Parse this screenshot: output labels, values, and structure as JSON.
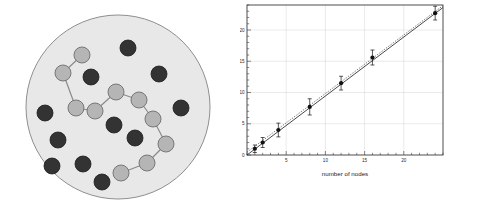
{
  "figure": {
    "panels": [
      "network-diagram",
      "speedup-chart"
    ]
  },
  "network": {
    "name": "network-diagram",
    "disc": {
      "fill": "#e8e8e8",
      "stroke": "#8f8f8f",
      "cx": 118,
      "cy": 107,
      "r": 92
    },
    "node_colors": {
      "light": "#b5b5b5",
      "light_stroke": "#6e6e6e",
      "dark": "#333333",
      "dark_stroke": "#1a1a1a"
    },
    "edge_color": "#8a8a8a",
    "light_nodes": [
      {
        "id": "L0",
        "x": 82,
        "y": 55,
        "r": 8
      },
      {
        "id": "L1",
        "x": 63,
        "y": 73,
        "r": 8
      },
      {
        "id": "L2",
        "x": 76,
        "y": 108,
        "r": 8
      },
      {
        "id": "L3",
        "x": 95,
        "y": 111,
        "r": 8
      },
      {
        "id": "L4",
        "x": 116,
        "y": 92,
        "r": 8
      },
      {
        "id": "L5",
        "x": 139,
        "y": 100,
        "r": 8
      },
      {
        "id": "L6",
        "x": 153,
        "y": 119,
        "r": 8
      },
      {
        "id": "L7",
        "x": 166,
        "y": 144,
        "r": 8
      },
      {
        "id": "L8",
        "x": 147,
        "y": 163,
        "r": 8
      },
      {
        "id": "L9",
        "x": 121,
        "y": 173,
        "r": 8
      }
    ],
    "edges": [
      [
        "L0",
        "L1"
      ],
      [
        "L1",
        "L2"
      ],
      [
        "L2",
        "L3"
      ],
      [
        "L3",
        "L4"
      ],
      [
        "L4",
        "L5"
      ],
      [
        "L5",
        "L6"
      ],
      [
        "L6",
        "L7"
      ],
      [
        "L7",
        "L8"
      ],
      [
        "L8",
        "L9"
      ]
    ],
    "dark_nodes": [
      {
        "id": "D0",
        "x": 128,
        "y": 48,
        "r": 8
      },
      {
        "id": "D1",
        "x": 91,
        "y": 77,
        "r": 8
      },
      {
        "id": "D2",
        "x": 159,
        "y": 74,
        "r": 8
      },
      {
        "id": "D3",
        "x": 45,
        "y": 113,
        "r": 8
      },
      {
        "id": "D4",
        "x": 181,
        "y": 108,
        "r": 8
      },
      {
        "id": "D5",
        "x": 58,
        "y": 140,
        "r": 8
      },
      {
        "id": "D6",
        "x": 114,
        "y": 125,
        "r": 8
      },
      {
        "id": "D7",
        "x": 135,
        "y": 138,
        "r": 8
      },
      {
        "id": "D8",
        "x": 52,
        "y": 166,
        "r": 8
      },
      {
        "id": "D9",
        "x": 83,
        "y": 164,
        "r": 8
      },
      {
        "id": "D10",
        "x": 102,
        "y": 182,
        "r": 8
      }
    ]
  },
  "chart_data": {
    "type": "scatter",
    "title": "",
    "xlabel": "number of nodes",
    "ylabel": "relative speed-up",
    "xlim": [
      0,
      25
    ],
    "ylim": [
      0,
      24
    ],
    "xticks": [
      5,
      10,
      15,
      20
    ],
    "xtick_labels": [
      "5",
      "10",
      "15",
      "20"
    ],
    "yticks": [
      0,
      5,
      10,
      15,
      20
    ],
    "ytick_labels": [
      "0",
      "5",
      "10",
      "15",
      "20"
    ],
    "grid": true,
    "legend": "none",
    "series": [
      {
        "name": "measured speed-up",
        "marker": "filled-circle",
        "color": "#111111",
        "x": [
          1,
          2,
          4,
          8,
          12,
          16,
          24
        ],
        "y": [
          1.0,
          2.0,
          4.0,
          7.7,
          11.5,
          15.6,
          22.7
        ],
        "yerr": [
          0.6,
          0.8,
          1.1,
          1.3,
          1.1,
          1.2,
          1.1
        ]
      }
    ],
    "fits": [
      {
        "name": "linear-fit-solid",
        "style": "solid",
        "color": "#1a1a1a",
        "x": [
          0.0,
          25.0
        ],
        "y": [
          0.0,
          23.6
        ]
      },
      {
        "name": "ideal-dotted",
        "style": "dotted",
        "color": "#555555",
        "x": [
          0.0,
          25.0
        ],
        "y": [
          0.45,
          23.9
        ]
      }
    ]
  }
}
